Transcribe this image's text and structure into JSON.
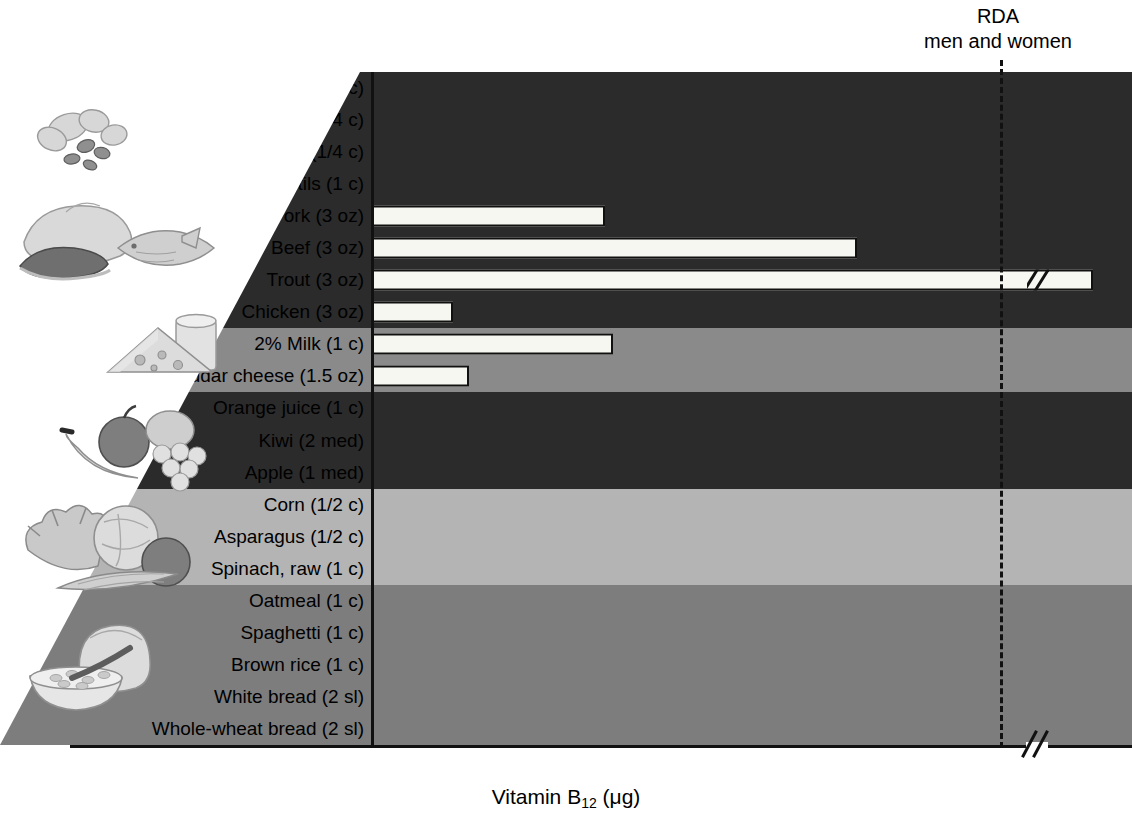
{
  "annotation": {
    "rda_line1": "RDA",
    "rda_line2": "men and women",
    "rda_value": 2.4
  },
  "axis": {
    "title_main": "Vitamin B",
    "title_sub": "12",
    "title_unit": " (μg)",
    "tick_labels": [
      "0",
      "0.5",
      "1.0",
      "1.5",
      "2.0",
      "2.4"
    ],
    "tick_values": [
      0,
      0.5,
      1.0,
      1.5,
      2.0,
      2.4
    ],
    "minor_step": 0.1,
    "has_break": true,
    "break_symbol": "//"
  },
  "colors": {
    "band_dark": "#2b2b2b",
    "band_medium": "#8a8a8a",
    "band_light": "#b4b4b4",
    "band_grain": "#7d7d7d",
    "bar_fill": "#f7f7f2",
    "bar_stroke": "#111111",
    "wedge": "#ffffff"
  },
  "groups": [
    {
      "name": "nuts-legumes-meat",
      "color": "#2b2b2b",
      "icon": "nuts-icon"
    },
    {
      "name": "dairy",
      "color": "#8a8a8a",
      "icon": "dairy-icon"
    },
    {
      "name": "fruit",
      "color": "#2b2b2b",
      "icon": "fruit-icon"
    },
    {
      "name": "vegetables",
      "color": "#b4b4b4",
      "icon": "vegetables-icon"
    },
    {
      "name": "grains",
      "color": "#7d7d7d",
      "icon": "grains-icon"
    }
  ],
  "chart_data": {
    "type": "bar",
    "orientation": "horizontal",
    "title": "",
    "xlabel": "Vitamin B12 (μg)",
    "ylabel": "",
    "xlim": [
      0,
      2.9
    ],
    "grid": false,
    "legend": "none",
    "reference_line": {
      "label": "RDA men and women",
      "value": 2.4,
      "style": "dashed"
    },
    "categories": [
      "Sunflower seeds (1/4 c)",
      "Walnuts (1/4 c)",
      "Peanuts (1/4 c)",
      "Lentils (1 c)",
      "Pork (3 oz)",
      "Beef (3 oz)",
      "Trout (3 oz)",
      "Chicken (3 oz)",
      "2% Milk (1 c)",
      "Cheddar cheese (1.5 oz)",
      "Orange juice (1 c)",
      "Kiwi (2 med)",
      "Apple (1 med)",
      "Corn (1/2 c)",
      "Asparagus (1/2 c)",
      "Spinach, raw (1 c)",
      "Oatmeal (1 c)",
      "Spaghetti (1 c)",
      "Brown rice (1 c)",
      "White bread (2 sl)",
      "Whole-wheat bread (2 sl)"
    ],
    "values": [
      0,
      0,
      0,
      0,
      0.89,
      1.85,
      2.75,
      0.31,
      0.92,
      0.37,
      0,
      0,
      0,
      0,
      0,
      0,
      0,
      0,
      0,
      0,
      0
    ],
    "truncated": [
      false,
      false,
      false,
      false,
      false,
      false,
      true,
      false,
      false,
      false,
      false,
      false,
      false,
      false,
      false,
      false,
      false,
      false,
      false,
      false,
      false
    ],
    "group_index": [
      0,
      0,
      0,
      0,
      0,
      0,
      0,
      0,
      1,
      1,
      2,
      2,
      2,
      3,
      3,
      3,
      4,
      4,
      4,
      4,
      4
    ]
  }
}
